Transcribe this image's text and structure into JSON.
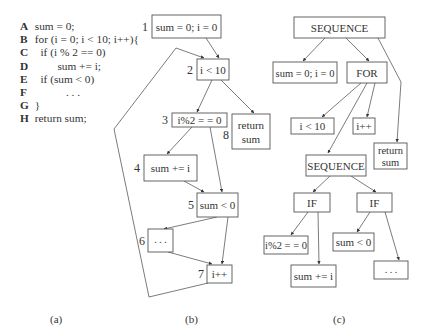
{
  "panel_a": {
    "caption": "(a)",
    "lines": [
      {
        "label": "A",
        "code": " sum = 0;"
      },
      {
        "label": "B",
        "code": " for (i = 0; i < 10; i++){"
      },
      {
        "label": "C",
        "code": "   if (i % 2 == 0)"
      },
      {
        "label": "D",
        "code": "         sum += i;"
      },
      {
        "label": "E",
        "code": "   if (sum < 0)"
      },
      {
        "label": "F",
        "code": "            . . ."
      },
      {
        "label": "G",
        "code": " }"
      },
      {
        "label": "H",
        "code": " return sum;"
      }
    ]
  },
  "panel_b": {
    "caption": "(b)",
    "title": "Control flow graph",
    "nodes": [
      {
        "id": "1",
        "text": "sum = 0; i = 0"
      },
      {
        "id": "2",
        "text": "i < 10"
      },
      {
        "id": "3",
        "text": "i%2 = = 0"
      },
      {
        "id": "4",
        "text": "sum += i"
      },
      {
        "id": "5",
        "text": "sum < 0"
      },
      {
        "id": "6",
        "text": ". . ."
      },
      {
        "id": "7",
        "text": "i++"
      },
      {
        "id": "8",
        "text_line1": "return",
        "text_line2": "sum"
      }
    ],
    "edges": [
      [
        "1",
        "2"
      ],
      [
        "2",
        "3"
      ],
      [
        "2",
        "8"
      ],
      [
        "3",
        "4"
      ],
      [
        "3",
        "5"
      ],
      [
        "4",
        "5"
      ],
      [
        "5",
        "6"
      ],
      [
        "5",
        "7"
      ],
      [
        "6",
        "7"
      ],
      [
        "7",
        "2"
      ]
    ]
  },
  "panel_c": {
    "caption": "(c)",
    "title": "Abstract syntax tree",
    "nodes": {
      "root": "SEQUENCE",
      "init": "sum = 0; i = 0",
      "for": "FOR",
      "cond": "i < 10",
      "incr": "i++",
      "ret_line1": "return",
      "ret_line2": "sum",
      "seq": "SEQUENCE",
      "if1": "IF",
      "if2": "IF",
      "if1_cond": "i%2 = = 0",
      "if1_body": "sum += i",
      "if2_cond": "sum < 0",
      "if2_body": ". . ."
    },
    "edges": [
      [
        "root",
        "init"
      ],
      [
        "root",
        "for"
      ],
      [
        "root",
        "ret"
      ],
      [
        "for",
        "cond"
      ],
      [
        "for",
        "seq"
      ],
      [
        "for",
        "incr"
      ],
      [
        "seq",
        "if1"
      ],
      [
        "seq",
        "if2"
      ],
      [
        "if1",
        "if1_cond"
      ],
      [
        "if1",
        "if1_body"
      ],
      [
        "if2",
        "if2_cond"
      ],
      [
        "if2",
        "if2_body"
      ]
    ]
  }
}
